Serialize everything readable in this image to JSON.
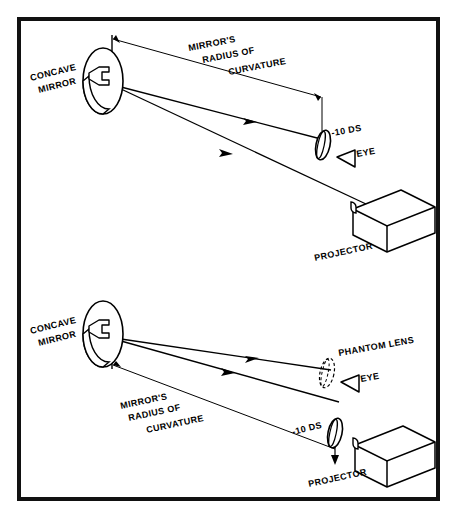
{
  "figure": {
    "type": "optical-ray-diagram",
    "background": "#ffffff",
    "ink_color": "#000000",
    "border_color": "#111111",
    "panels": [
      {
        "id": "top-panel",
        "name": "minus-lens-before-eye",
        "labels": {
          "mirror": "CONCAVE\nMIRROR",
          "mirror_line1": "CONCAVE",
          "mirror_line2": "MIRROR",
          "radius_line1": "MIRROR'S",
          "radius_line2": "RADIUS OF",
          "radius_line3": "CURVATURE",
          "lens_power": "-10 DS",
          "eye": "EYE",
          "projector": "PROJECTOR"
        }
      },
      {
        "id": "bottom-panel",
        "name": "minus-lens-at-projector",
        "labels": {
          "mirror_line1": "CONCAVE",
          "mirror_line2": "MIRROR",
          "radius_line1": "MIRROR'S",
          "radius_line2": "RADIUS OF",
          "radius_line3": "CURVATURE",
          "lens_power": "-10 DS",
          "phantom_lens": "PHANTOM LENS",
          "eye": "EYE",
          "projector": "PROJECTOR"
        }
      }
    ],
    "icon_names": [
      "concave-mirror-icon",
      "minus-lens-icon",
      "phantom-lens-icon",
      "eye-icon",
      "projector-icon",
      "ray-arrowhead-icon",
      "dimension-arrow-icon"
    ]
  }
}
